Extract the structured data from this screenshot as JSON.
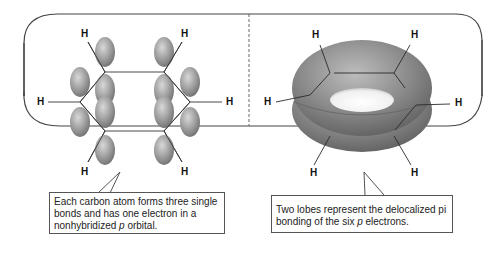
{
  "left_panel": {
    "h_labels": [
      "H",
      "H",
      "H",
      "H",
      "H",
      "H"
    ],
    "caption": {
      "line1": "Each carbon atom forms three single",
      "line2": "bonds and has one electron in a",
      "line3_pre": "nonhybridized ",
      "line3_italic": "p",
      "line3_post": " orbital."
    }
  },
  "right_panel": {
    "h_labels": [
      "H",
      "H",
      "H",
      "H",
      "H",
      "H"
    ],
    "caption": {
      "line1": "Two lobes represent the delocalized pi",
      "line2_pre": "bonding of the six ",
      "line2_italic": "p",
      "line2_post": " electrons."
    }
  },
  "colors": {
    "border": "#444444",
    "divider": "#666666",
    "lobe_fill": "#9a9a9a",
    "torus_fill": "#8a8a8a"
  }
}
